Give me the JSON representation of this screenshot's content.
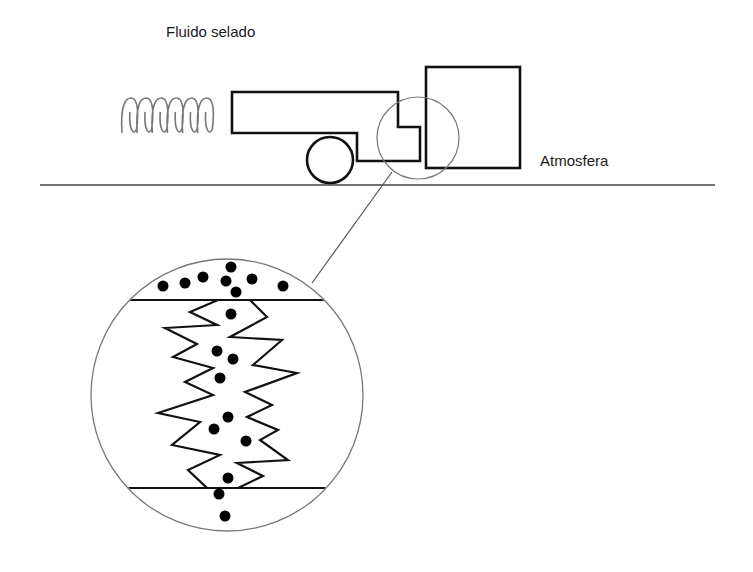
{
  "labels": {
    "sealed_fluid": "Fluido selado",
    "atmosphere": "Atmosfera"
  },
  "colors": {
    "stroke": "#111111",
    "thin_stroke": "#777777",
    "background": "#ffffff"
  },
  "geometry": {
    "ground_line": {
      "x1": 40,
      "y1": 185,
      "x2": 715,
      "y2": 185
    },
    "spring": {
      "x": 122,
      "y": 98,
      "width": 100,
      "height": 35,
      "loops": 6
    },
    "seal_body_points": "232,92 398,92 398,127 420,127 420,161 357,161 357,133 232,133",
    "wheel": {
      "cx": 330,
      "cy": 160,
      "r": 23
    },
    "mating_ring": {
      "x": 426,
      "y": 67,
      "width": 94,
      "height": 101
    },
    "detail_circle": {
      "cx": 418,
      "cy": 138,
      "r": 41
    },
    "connector_line": {
      "x1": 392,
      "y1": 172,
      "x2": 312,
      "y2": 283
    },
    "magnified_circle": {
      "cx": 227,
      "cy": 395,
      "r": 136
    },
    "top_surface_line": {
      "x1": 128,
      "y1": 300,
      "x2": 326,
      "y2": 300
    },
    "bottom_surface_line": {
      "x1": 128,
      "y1": 488,
      "x2": 326,
      "y2": 488
    },
    "left_zigzag": "128,300 218,300 190,312 217,325 165,328 197,344 173,357 213,368 185,382 213,395 158,413 200,422 172,445 220,455 188,470 207,488 128,488",
    "right_zigzag": "326,300 250,300 267,317 230,337 282,340 253,365 297,373 245,392 272,405 247,417 278,430 260,440 288,460 237,463 263,476 238,488 326,488",
    "particles": [
      [
        163,
        286
      ],
      [
        185,
        283
      ],
      [
        203,
        277
      ],
      [
        231,
        267
      ],
      [
        226,
        281
      ],
      [
        252,
        279
      ],
      [
        283,
        286
      ],
      [
        236,
        292
      ],
      [
        231,
        314
      ],
      [
        217,
        351
      ],
      [
        233,
        359
      ],
      [
        220,
        378
      ],
      [
        228,
        417
      ],
      [
        214,
        429
      ],
      [
        246,
        441
      ],
      [
        228,
        478
      ],
      [
        219,
        494
      ],
      [
        225,
        516
      ]
    ]
  }
}
